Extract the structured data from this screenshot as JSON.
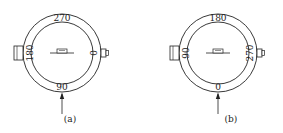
{
  "diagrams": [
    {
      "caption": "(a)",
      "center": [
        62,
        53
      ],
      "labels": {
        "top": "270",
        "left": "180",
        "right": "0",
        "bottom": "90"
      }
    },
    {
      "caption": "(b)",
      "center": [
        218,
        53
      ],
      "labels": {
        "top": "180",
        "left": "90",
        "right": "270",
        "bottom": "0"
      }
    }
  ],
  "colors": {
    "stroke": "#222222",
    "background": "#ffffff"
  }
}
